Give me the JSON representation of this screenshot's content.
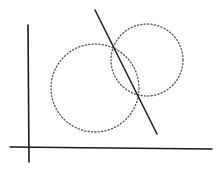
{
  "diagram": {
    "background": "#ffffff",
    "stroke_color": "#1a1a1a",
    "dot_color": "#555555",
    "axes": {
      "x_axis": {
        "x1": 10,
        "y1": 147,
        "x2": 212,
        "y2": 149
      },
      "y_axis": {
        "x1": 28,
        "y1": 25,
        "x2": 29,
        "y2": 162
      }
    },
    "circles": [
      {
        "name": "left-circle",
        "cx": 95,
        "cy": 88,
        "r": 44,
        "style": "dotted"
      },
      {
        "name": "right-circle",
        "cx": 147,
        "cy": 60,
        "r": 36,
        "style": "dotted"
      }
    ],
    "line": {
      "name": "radical-axis",
      "x1": 95,
      "y1": 10,
      "x2": 157,
      "y2": 134,
      "style": "solid"
    },
    "intersections": [
      {
        "x": 114,
        "y": 48
      },
      {
        "x": 137,
        "y": 94
      }
    ]
  }
}
